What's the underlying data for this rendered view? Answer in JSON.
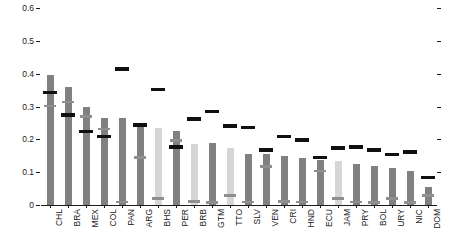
{
  "chart_data": {
    "type": "bar",
    "title": "",
    "subtitle": "",
    "xlabel": "",
    "ylabel": "",
    "ylim": [
      0,
      0.62
    ],
    "yticks": [
      0,
      0.1,
      0.2,
      0.3,
      0.4,
      0.5,
      0.6
    ],
    "ytick_labels": [
      "0",
      "0.1",
      "0.2",
      "0.3",
      "0.4",
      "0.5",
      "0.6"
    ],
    "grid": false,
    "legend_position": "none",
    "legend": [],
    "categories": [
      "CHL",
      "BRA",
      "MEX",
      "COL",
      "PAN",
      "ARG",
      "BHS",
      "PER",
      "BRB",
      "GTM",
      "TTO",
      "SLV",
      "VEN",
      "CRI",
      "HND",
      "ECU",
      "JAM",
      "PRY",
      "BOL",
      "URY",
      "NIC",
      "DOM"
    ],
    "series": [
      {
        "name": "bar",
        "values": [
          0.395,
          0.36,
          0.3,
          0.265,
          0.265,
          0.245,
          0.233,
          0.225,
          0.185,
          0.19,
          0.175,
          0.155,
          0.155,
          0.148,
          0.143,
          0.138,
          0.135,
          0.125,
          0.12,
          0.113,
          0.103,
          0.055
        ]
      },
      {
        "name": "black-marker",
        "values": [
          0.343,
          0.275,
          0.225,
          0.21,
          0.415,
          0.245,
          0.353,
          0.178,
          0.263,
          0.285,
          0.242,
          0.237,
          0.168,
          0.21,
          0.198,
          0.145,
          0.175,
          0.178,
          0.168,
          0.155,
          0.162,
          0.085
        ]
      },
      {
        "name": "grey-marker",
        "values": [
          0.303,
          0.315,
          0.27,
          0.232,
          0.01,
          0.145,
          0.02,
          0.197,
          0.012,
          0.008,
          0.03,
          0.01,
          0.118,
          0.012,
          0.01,
          0.105,
          0.02,
          0.01,
          0.008,
          0.02,
          0.008,
          0.03
        ]
      }
    ],
    "bar_shades": [
      "dark",
      "dark",
      "dark",
      "dark",
      "dark",
      "dark",
      "light",
      "dark",
      "light",
      "dark",
      "light",
      "dark",
      "dark",
      "dark",
      "dark",
      "dark",
      "light",
      "dark",
      "dark",
      "dark",
      "dark",
      "dark"
    ],
    "colors": {
      "bar_dark": "#808080",
      "bar_light": "#d6d6d6",
      "marker_black": "#101010",
      "marker_grey": "#8f8f8f",
      "axis": "#1a1a1a",
      "background": "#ffffff"
    }
  }
}
